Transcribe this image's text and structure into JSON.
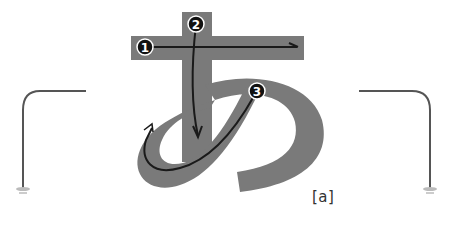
{
  "diagram": {
    "character": "あ",
    "caption": "[a]",
    "strokes": [
      {
        "order": "1",
        "direction": "left-to-right horizontal"
      },
      {
        "order": "2",
        "direction": "top-to-bottom vertical"
      },
      {
        "order": "3",
        "direction": "curved loop"
      }
    ],
    "colors": {
      "glyph_fill": "#7a7a7a",
      "stroke_line": "#1a1a1a",
      "badge_fill": "#111111",
      "badge_text": "#ffffff",
      "lamp": "#555555"
    },
    "decorations": [
      "left-lamp-stand",
      "right-lamp-stand"
    ]
  }
}
